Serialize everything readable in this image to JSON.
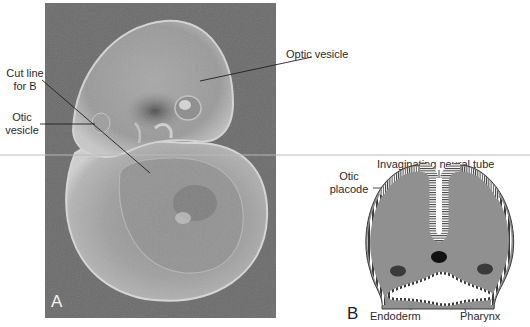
{
  "figure": {
    "panel_a": {
      "letter": "A",
      "description": "Photograph of early embryo (lateral view)",
      "labels": {
        "cut_line_line1": "Cut line",
        "cut_line_line2": "for B",
        "otic_vesicle_line1": "Otic",
        "otic_vesicle_line2": "vesicle",
        "optic_vesicle": "Optic vesicle"
      }
    },
    "panel_b": {
      "letter": "B",
      "description": "Cross-section diagram through cut line",
      "labels": {
        "invaginating_neural_tube": "Invaginating neural tube",
        "otic_placode_line1": "Otic",
        "otic_placode_line2": "placode",
        "endoderm": "Endoderm",
        "pharynx": "Pharynx"
      }
    },
    "colors": {
      "photo_background": "#6a6a6a",
      "tissue_gray": "#8f8f8f",
      "diagram_fill": "#909090",
      "horizontal_rule": "#b8b8b8",
      "text": "#2a2a2a"
    }
  }
}
